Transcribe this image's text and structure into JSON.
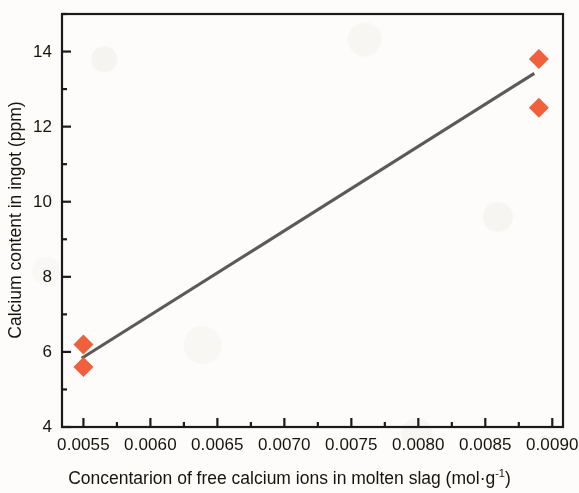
{
  "chart_data": {
    "type": "scatter",
    "title": "",
    "xlabel": "Concentarion of free calcium ions in molten slag (mol·g⁻¹)",
    "xlabel_base": "Concentarion of free calcium ions in molten slag (mol·g",
    "xlabel_sup": "-1",
    "xlabel_tail": ")",
    "ylabel": "Calcium content in ingot (ppm)",
    "xlim": [
      0.00534,
      0.00908
    ],
    "ylim": [
      4.0,
      15.0
    ],
    "grid": false,
    "legend": "none",
    "marker": {
      "shape": "diamond",
      "color": "#F0603C",
      "size_px": 20
    },
    "series": [
      {
        "name": "Measured calcium content",
        "points": [
          {
            "x": 0.0055,
            "y": 6.2
          },
          {
            "x": 0.0055,
            "y": 5.6
          },
          {
            "x": 0.0089,
            "y": 13.8
          },
          {
            "x": 0.0089,
            "y": 12.5
          }
        ]
      },
      {
        "name": "Linear fit",
        "type": "line",
        "color": "#5A5A5A",
        "endpoints": [
          {
            "x": 0.005487,
            "y": 5.83
          },
          {
            "x": 0.008866,
            "y": 13.42
          }
        ]
      }
    ],
    "x_ticks": [
      {
        "value": 0.0055,
        "label": "0.0055"
      },
      {
        "value": 0.006,
        "label": "0.0060"
      },
      {
        "value": 0.0065,
        "label": "0.0065"
      },
      {
        "value": 0.007,
        "label": "0.0070"
      },
      {
        "value": 0.0075,
        "label": "0.0075"
      },
      {
        "value": 0.008,
        "label": "0.0080"
      },
      {
        "value": 0.0085,
        "label": "0.0085"
      },
      {
        "value": 0.009,
        "label": "0.0090"
      }
    ],
    "x_minor_ticks": [
      0.00525,
      0.00575,
      0.00625,
      0.00675,
      0.00725,
      0.00775,
      0.00825,
      0.00875
    ],
    "y_ticks": [
      {
        "value": 14,
        "label": "14"
      },
      {
        "value": 12,
        "label": "12"
      },
      {
        "value": 10,
        "label": "10"
      },
      {
        "value": 8,
        "label": "8"
      },
      {
        "value": 6,
        "label": "6"
      },
      {
        "value": 4,
        "label": "4"
      }
    ],
    "y_minor_ticks": [
      15,
      13,
      11,
      9,
      7,
      5
    ],
    "axis_color": "#1a1a1a"
  }
}
